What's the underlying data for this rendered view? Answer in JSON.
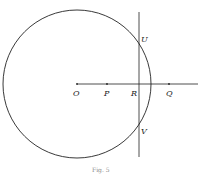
{
  "diagram": {
    "labels": {
      "O": "O",
      "P": "P",
      "R": "R",
      "Q": "Q",
      "U": "U",
      "V": "V"
    },
    "caption": "Fig. 5",
    "colors": {
      "stroke": "#222222",
      "background": "#ffffff"
    }
  }
}
